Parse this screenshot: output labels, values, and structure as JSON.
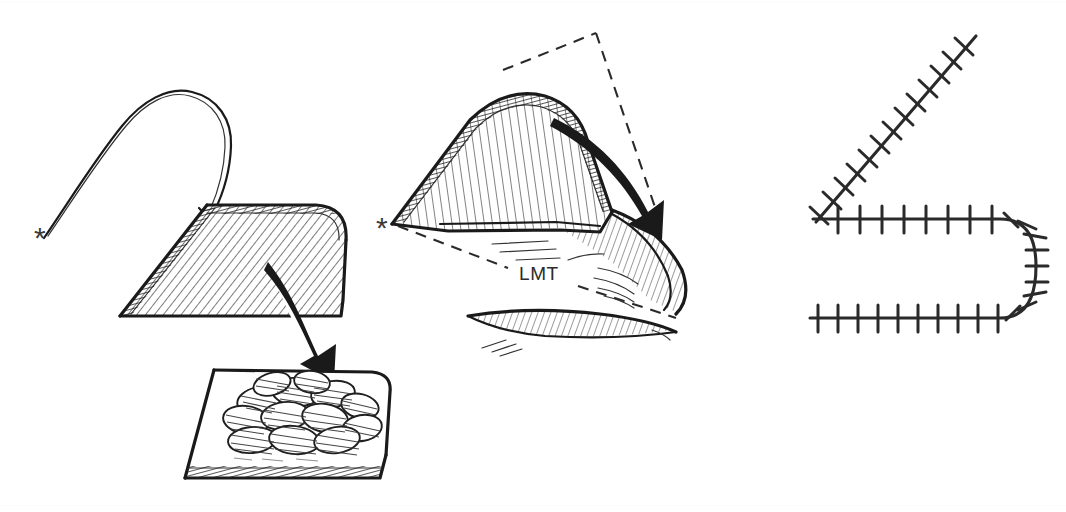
{
  "figure": {
    "domain_note": "three-panel pen-and-ink surgical line drawing",
    "background_color": "#ffffff",
    "ink_color": "#1a1a1a",
    "panel_count": 3
  },
  "labels": {
    "lmt": "LMT",
    "asterisk": "*"
  },
  "panels": [
    {
      "id": "panel-1",
      "name": "flap-harvest",
      "caption": "",
      "elements": [
        {
          "name": "needle-suture-curve",
          "label": ""
        },
        {
          "name": "pivot-asterisk",
          "label": "*"
        },
        {
          "name": "hatched-flap",
          "label": ""
        },
        {
          "name": "transfer-arrow",
          "label": ""
        },
        {
          "name": "recipient-bed",
          "label": ""
        },
        {
          "name": "granulation-tissue",
          "label": ""
        }
      ]
    },
    {
      "id": "panel-2",
      "name": "flap-rotation",
      "caption": "LMT",
      "elements": [
        {
          "name": "pivot-asterisk",
          "label": "*"
        },
        {
          "name": "dashed-triangle",
          "label": ""
        },
        {
          "name": "lmt-dashed-axis",
          "label": "LMT"
        },
        {
          "name": "hatched-flap-raised",
          "label": ""
        },
        {
          "name": "rotation-arrow",
          "label": ""
        },
        {
          "name": "donor-defect",
          "label": ""
        }
      ]
    },
    {
      "id": "panel-3",
      "name": "sutured-closure",
      "caption": "",
      "elements": [
        {
          "name": "diagonal-suture-line",
          "label": ""
        },
        {
          "name": "upper-horizontal-suture-line",
          "label": ""
        },
        {
          "name": "u-turn-suture-line",
          "label": ""
        },
        {
          "name": "lower-horizontal-suture-line",
          "label": ""
        }
      ]
    }
  ],
  "suture_counts": {
    "diagonal_ticks": 13,
    "upper_horizontal_ticks": 9,
    "curve_ticks": 9,
    "lower_horizontal_ticks": 12
  },
  "colors": {
    "ink": "#1a1a1a",
    "hatch": "#2b2b2b",
    "dashed": "#2a2a2a",
    "paper": "#ffffff",
    "label_text": "#2c2c2c"
  }
}
